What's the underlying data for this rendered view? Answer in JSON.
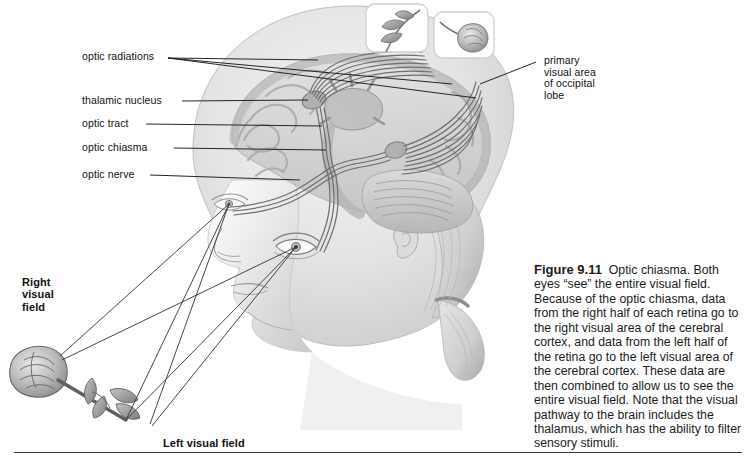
{
  "figure": {
    "number": "Figure 9.11",
    "caption": "Optic chiasma. Both eyes “see” the entire visual field. Because of the optic chiasma, data from the right half of each retina go to the right visual area of the cerebral cortex, and data from the left half of the retina go to the left visual area of the cerebral cortex. These data are then combined to allow us to see the entire visual field. Note that the visual pathway to the brain includes the thalamus, which has the ability to filter sensory stimuli."
  },
  "labels": {
    "optic_radiations": "optic radiations",
    "thalamic_nucleus": "thalamic nucleus",
    "optic_tract": "optic tract",
    "optic_chiasma": "optic chiasma",
    "optic_nerve": "optic nerve",
    "primary_visual_area": "primary\nvisual area\nof occipital\nlobe",
    "right_visual_field": "Right\nvisual\nfield",
    "left_visual_field": "Left visual field"
  },
  "illustration": {
    "subject": "lateral view of human head with transparent brain showing visual pathway",
    "stimulus": "rose",
    "inset_left": "rose stem and leaves as seen by one visual half-field",
    "inset_right": "rose bloom as seen by the other visual half-field",
    "structures": [
      "eye",
      "optic nerve",
      "optic chiasma",
      "optic tract",
      "thalamic nucleus",
      "optic radiations",
      "primary visual area of occipital lobe",
      "cerebrum",
      "cerebellum"
    ]
  },
  "colors": {
    "ink": "#111111",
    "rule": "#3a3a3a",
    "skin_light": "#ededed",
    "skin_mid": "#d6d6d6",
    "skin_shadow": "#b5b5b5",
    "brain_light": "#dcdcdc",
    "brain_mid": "#c2c2c2",
    "brain_dark": "#9f9f9f",
    "pathway": "#6f6f6f",
    "leader": "#1a1a1a",
    "sightline": "#3d3d3d"
  }
}
